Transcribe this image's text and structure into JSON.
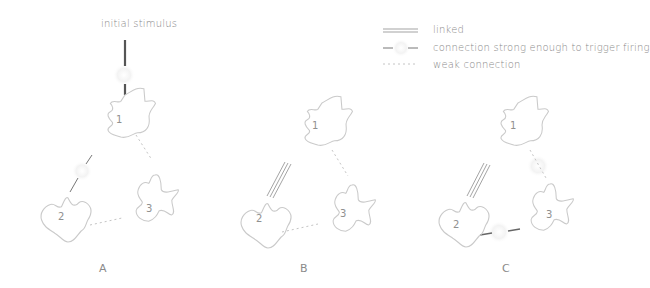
{
  "stimulus_label": "initial stimulus",
  "legend": {
    "items": [
      {
        "symbol": "double-line",
        "label": "linked"
      },
      {
        "symbol": "broken-dash-with-glow",
        "label": "connection strong enough to trigger firing"
      },
      {
        "symbol": "dotted-line",
        "label": "weak connection"
      }
    ]
  },
  "panels": [
    {
      "id": "A",
      "label": "A",
      "nodes": [
        {
          "label": "1"
        },
        {
          "label": "2"
        },
        {
          "label": "3"
        }
      ],
      "connections": [
        {
          "from": "stimulus",
          "to": "1",
          "type": "firing"
        },
        {
          "from": "1",
          "to": "2",
          "type": "firing"
        },
        {
          "from": "1",
          "to": "3",
          "type": "weak"
        },
        {
          "from": "2",
          "to": "3",
          "type": "weak"
        }
      ]
    },
    {
      "id": "B",
      "label": "B",
      "nodes": [
        {
          "label": "1"
        },
        {
          "label": "2"
        },
        {
          "label": "3"
        }
      ],
      "connections": [
        {
          "from": "1",
          "to": "2",
          "type": "linked"
        },
        {
          "from": "1",
          "to": "3",
          "type": "weak"
        },
        {
          "from": "2",
          "to": "3",
          "type": "weak"
        }
      ]
    },
    {
      "id": "C",
      "label": "C",
      "nodes": [
        {
          "label": "1"
        },
        {
          "label": "2"
        },
        {
          "label": "3"
        }
      ],
      "connections": [
        {
          "from": "1",
          "to": "2",
          "type": "linked"
        },
        {
          "from": "1",
          "to": "3",
          "type": "weak-with-glow"
        },
        {
          "from": "2",
          "to": "3",
          "type": "firing"
        }
      ]
    }
  ],
  "colors": {
    "outline": "#c8c8c8",
    "strong_line": "#555555",
    "weak_line": "#bdbdbd",
    "glow": "#f2f2f2"
  }
}
